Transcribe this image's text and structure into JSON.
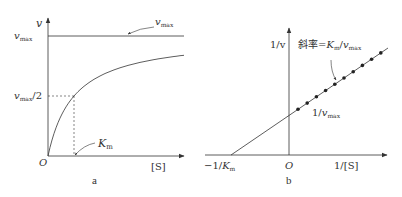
{
  "panel_a": {
    "caption": "a",
    "y_axis_label": "v",
    "x_axis_label": "[S]",
    "origin_label": "O",
    "vmax_tick_label": {
      "main": "v",
      "sub": "max"
    },
    "half_vmax_tick_label": {
      "main": "v",
      "sub": "max",
      "suffix": "/2"
    },
    "vmax_annotation": {
      "main": "v",
      "sub": "max"
    },
    "km_annotation": {
      "main": "K",
      "sub": "m"
    },
    "curve": "Michaelis-Menten hyperbola approaching v_max"
  },
  "panel_b": {
    "caption": "b",
    "y_axis_label": "1/v",
    "x_axis_label": "1/[S]",
    "origin_label": "O",
    "x_intercept_label": {
      "prefix": "−1/",
      "main": "K",
      "sub": "m"
    },
    "y_intercept_label": {
      "prefix": "1/",
      "main": "v",
      "sub": "max"
    },
    "slope_label": {
      "prefix": "斜率=",
      "k": "K",
      "ksub": "m",
      "sep": "/",
      "v": "v",
      "vsub": "max"
    },
    "data_points_count": 10
  },
  "colors": {
    "ink": "#333333",
    "background": "#ffffff"
  }
}
